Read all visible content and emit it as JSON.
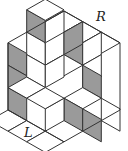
{
  "figure": {
    "labels": {
      "right": "R",
      "left": "L"
    },
    "colors": {
      "shaded": "#9a9a9a",
      "unshaded": "#ffffff",
      "stroke": "#333333"
    },
    "tiles": [
      {
        "type": "left",
        "at": [
          0,
          3,
          0
        ],
        "shaded": true
      },
      {
        "type": "left",
        "at": [
          0,
          3,
          1
        ],
        "shaded": true
      },
      {
        "type": "left",
        "at": [
          0,
          3,
          2
        ],
        "shaded": true
      },
      {
        "type": "left",
        "at": [
          0,
          2,
          -1
        ],
        "shaded": true
      },
      {
        "type": "left",
        "at": [
          0,
          2,
          0
        ],
        "shaded": false
      },
      {
        "type": "left",
        "at": [
          0,
          2,
          1
        ],
        "shaded": false
      },
      {
        "type": "top",
        "at": [
          0,
          1,
          -1
        ],
        "shaded": false
      },
      {
        "type": "top",
        "at": [
          0,
          0,
          0
        ],
        "shaded": false
      },
      {
        "type": "right",
        "at": [
          0,
          0,
          0
        ],
        "shaded": false
      },
      {
        "type": "left",
        "at": [
          1,
          1,
          0
        ],
        "shaded": true
      },
      {
        "type": "right",
        "at": [
          1,
          1,
          0
        ],
        "shaded": false
      },
      {
        "type": "top",
        "at": [
          1,
          0,
          0
        ],
        "shaded": false
      },
      {
        "type": "right",
        "at": [
          1,
          0,
          0
        ],
        "shaded": true
      },
      {
        "type": "top",
        "at": [
          2,
          0,
          0
        ],
        "shaded": false
      },
      {
        "type": "right",
        "at": [
          2,
          0,
          0
        ],
        "shaded": false
      },
      {
        "type": "right",
        "at": [
          2,
          0,
          1
        ],
        "shaded": false
      },
      {
        "type": "top",
        "at": [
          1,
          1,
          1
        ],
        "shaded": false
      },
      {
        "type": "left",
        "at": [
          2,
          1,
          1
        ],
        "shaded": true
      },
      {
        "type": "right",
        "at": [
          1,
          1,
          1
        ],
        "shaded": false
      },
      {
        "type": "top",
        "at": [
          2,
          1,
          2
        ],
        "shaded": false
      },
      {
        "type": "left",
        "at": [
          3,
          1,
          2
        ],
        "shaded": false
      },
      {
        "type": "left",
        "at": [
          2,
          2,
          2
        ],
        "shaded": true
      },
      {
        "type": "left",
        "at": [
          3,
          2,
          2
        ],
        "shaded": true
      },
      {
        "type": "right",
        "at": [
          2,
          2,
          2
        ],
        "shaded": false
      },
      {
        "type": "top",
        "at": [
          0,
          2,
          2
        ],
        "shaded": false
      },
      {
        "type": "top",
        "at": [
          1,
          2,
          2
        ],
        "shaded": false
      },
      {
        "type": "top",
        "at": [
          0,
          3,
          3
        ],
        "shaded": false
      },
      {
        "type": "top",
        "at": [
          1,
          3,
          3
        ],
        "shaded": false
      },
      {
        "type": "top",
        "at": [
          2,
          3,
          3
        ],
        "shaded": false
      }
    ]
  }
}
